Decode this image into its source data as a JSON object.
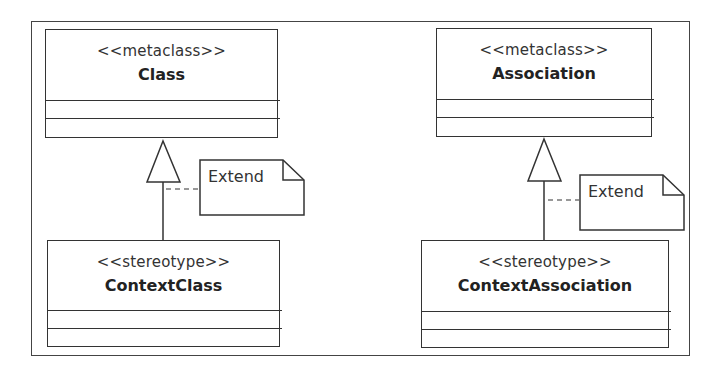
{
  "diagram": {
    "type": "UML profile diagram",
    "classes": [
      {
        "id": "class",
        "stereotype": "<<metaclass>>",
        "name": "Class"
      },
      {
        "id": "association",
        "stereotype": "<<metaclass>>",
        "name": "Association"
      },
      {
        "id": "context-class",
        "stereotype": "<<stereotype>>",
        "name": "ContextClass"
      },
      {
        "id": "context-association",
        "stereotype": "<<stereotype>>",
        "name": "ContextAssociation"
      }
    ],
    "notes": [
      {
        "id": "note-left",
        "text": "Extend"
      },
      {
        "id": "note-right",
        "text": "Extend"
      }
    ],
    "relations": [
      {
        "from": "ContextClass",
        "to": "Class",
        "kind": "extension"
      },
      {
        "from": "ContextAssociation",
        "to": "Association",
        "kind": "extension"
      }
    ],
    "colors": {
      "line": "#333333",
      "background": "#ffffff",
      "text": "#222222"
    }
  }
}
